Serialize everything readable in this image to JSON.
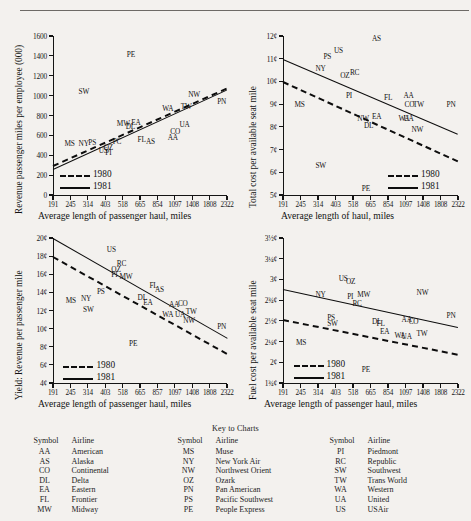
{
  "page": {
    "rule": "horizontal-rule"
  },
  "axis_ticks": {
    "x_values": [
      "191",
      "245",
      "314",
      "403",
      "518",
      "665",
      "854",
      "1097",
      "1408",
      "1808",
      "2322"
    ],
    "x_values_alt": [
      "191",
      "245",
      "314",
      "403",
      "518",
      "665",
      "857",
      "1097",
      "1408",
      "1808",
      "2322"
    ]
  },
  "legend": {
    "series_1980": "1980",
    "series_1981": "1981"
  },
  "charts": [
    {
      "id": "revenue-passenger-miles-per-employee",
      "ytitle": "Revenue passenger miles per employee (000)",
      "xtitle": "Average length of passenger haul, miles",
      "yticks": [
        "0",
        "200",
        "400",
        "600",
        "800",
        "1000",
        "1200",
        "1400",
        "1600"
      ],
      "xticks": [
        "191",
        "245",
        "314",
        "403",
        "518",
        "665",
        "854",
        "1097",
        "1408",
        "1808",
        "2322"
      ],
      "points": [
        "MS",
        "NY",
        "PS",
        "US",
        "OZ",
        "PI",
        "PC",
        "MW",
        "DL",
        "EA",
        "FL",
        "AS",
        "AA",
        "CO",
        "UA",
        "WA",
        "TW",
        "NW",
        "PN",
        "SW",
        "PE"
      ]
    },
    {
      "id": "total-cost-per-available-seat-mile",
      "ytitle": "Total cost per available seat mile",
      "xtitle": "Average length of haul, miles",
      "yticks": [
        "5¢",
        "6¢",
        "7¢",
        "8¢",
        "9¢",
        "10¢",
        "11¢",
        "12¢"
      ],
      "xticks": [
        "191",
        "245",
        "314",
        "403",
        "518",
        "665",
        "854",
        "1097",
        "1408",
        "1808",
        "2322"
      ],
      "points": [
        "MS",
        "NY",
        "PS",
        "US",
        "OZ",
        "RC",
        "PI",
        "NW",
        "DL",
        "EA",
        "FL",
        "WA",
        "UA",
        "AA",
        "CO",
        "TW",
        "NW",
        "PN",
        "AS",
        "SW",
        "PE"
      ]
    },
    {
      "id": "yield-revenue-per-passenger-mile",
      "ytitle": "Yield: Revenue per passenger mile",
      "xtitle": "Average length of passenger haul, miles",
      "yticks": [
        "4¢",
        "6¢",
        "8¢",
        "10¢",
        "12¢",
        "14¢",
        "16¢",
        "18¢",
        "20¢"
      ],
      "xticks": [
        "191",
        "245",
        "314",
        "403",
        "518",
        "665",
        "857",
        "1097",
        "1408",
        "1808",
        "2322"
      ],
      "points": [
        "MS",
        "NY",
        "PS",
        "US",
        "OZ",
        "RC",
        "PI",
        "MW",
        "DL",
        "EA",
        "FL",
        "AS",
        "WA",
        "AA",
        "CO",
        "UA",
        "TW",
        "NW",
        "PN",
        "SW",
        "PE"
      ]
    },
    {
      "id": "fuel-cost-per-available-seat-mile",
      "ytitle": "Fuel cost per available seat mile",
      "xtitle": "Average length of passenger haul, miles",
      "yticks": [
        "1¾¢",
        "2¢",
        "2¼¢",
        "2½¢",
        "2¾¢",
        "3¢",
        "3¼¢",
        "3½¢"
      ],
      "xticks": [
        "191",
        "245",
        "314",
        "403",
        "518",
        "665",
        "854",
        "1097",
        "1408",
        "1808",
        "2322"
      ],
      "points": [
        "MS",
        "NY",
        "PS",
        "SW",
        "US",
        "OZ",
        "PI",
        "RC",
        "MW",
        "DL",
        "FL",
        "EA",
        "WA",
        "UA",
        "AA",
        "CO",
        "TW",
        "NW",
        "PN",
        "PE"
      ]
    }
  ],
  "key": {
    "title": "Key to Charts",
    "head_symbol": "Symbol",
    "head_airline": "Airline",
    "columns": [
      [
        {
          "symbol": "AA",
          "airline": "American"
        },
        {
          "symbol": "AS",
          "airline": "Alaska"
        },
        {
          "symbol": "CO",
          "airline": "Continental"
        },
        {
          "symbol": "DL",
          "airline": "Delta"
        },
        {
          "symbol": "EA",
          "airline": "Eastern"
        },
        {
          "symbol": "FL",
          "airline": "Frontier"
        },
        {
          "symbol": "MW",
          "airline": "Midway"
        }
      ],
      [
        {
          "symbol": "MS",
          "airline": "Muse"
        },
        {
          "symbol": "NY",
          "airline": "New York Air"
        },
        {
          "symbol": "NW",
          "airline": "Northwest Orient"
        },
        {
          "symbol": "OZ",
          "airline": "Ozark"
        },
        {
          "symbol": "PN",
          "airline": "Pan American"
        },
        {
          "symbol": "PS",
          "airline": "Pacific Southwest"
        },
        {
          "symbol": "PE",
          "airline": "People Express"
        }
      ],
      [
        {
          "symbol": "PI",
          "airline": "Piedmont"
        },
        {
          "symbol": "RC",
          "airline": "Republic"
        },
        {
          "symbol": "SW",
          "airline": "Southwest"
        },
        {
          "symbol": "TW",
          "airline": "Trans World"
        },
        {
          "symbol": "WA",
          "airline": "Western"
        },
        {
          "symbol": "UA",
          "airline": "United"
        },
        {
          "symbol": "US",
          "airline": "USAir"
        }
      ]
    ]
  },
  "chart_data": [
    {
      "type": "scatter",
      "title": "Revenue passenger miles per employee (000)",
      "xlabel": "Average length of passenger haul, miles",
      "ylabel": "Revenue passenger miles per employee (000)",
      "xticklabels": [
        "191",
        "245",
        "314",
        "403",
        "518",
        "665",
        "854",
        "1097",
        "1408",
        "1808",
        "2322"
      ],
      "yticklabels": [
        "0",
        "200",
        "400",
        "600",
        "800",
        "1000",
        "1200",
        "1400",
        "1600"
      ],
      "ylim": [
        0,
        1600
      ],
      "xscale": "log-ordinal",
      "grid": false,
      "legend": [
        "1980",
        "1981"
      ],
      "legend_position": "lower-left-inside",
      "points": [
        {
          "label": "MS",
          "x": 245,
          "y": 520
        },
        {
          "label": "NY",
          "x": 300,
          "y": 520
        },
        {
          "label": "PS",
          "x": 345,
          "y": 530
        },
        {
          "label": "US",
          "x": 400,
          "y": 450
        },
        {
          "label": "OZ",
          "x": 430,
          "y": 480
        },
        {
          "label": "PI",
          "x": 440,
          "y": 430
        },
        {
          "label": "PC",
          "x": 490,
          "y": 545
        },
        {
          "label": "MW",
          "x": 520,
          "y": 720
        },
        {
          "label": "DL",
          "x": 590,
          "y": 690
        },
        {
          "label": "EA",
          "x": 640,
          "y": 730
        },
        {
          "label": "FL",
          "x": 700,
          "y": 560
        },
        {
          "label": "AS",
          "x": 790,
          "y": 545
        },
        {
          "label": "AA",
          "x": 1080,
          "y": 580
        },
        {
          "label": "CO",
          "x": 1120,
          "y": 640
        },
        {
          "label": "UA",
          "x": 1280,
          "y": 710
        },
        {
          "label": "WA",
          "x": 1000,
          "y": 880
        },
        {
          "label": "TW",
          "x": 1300,
          "y": 900
        },
        {
          "label": "NW",
          "x": 1450,
          "y": 1020
        },
        {
          "label": "PN",
          "x": 2200,
          "y": 950
        },
        {
          "label": "SW",
          "x": 300,
          "y": 1050
        },
        {
          "label": "PE",
          "x": 600,
          "y": 1420
        }
      ],
      "series": [
        {
          "name": "1980",
          "style": "dashed",
          "x": [
            191,
            2322
          ],
          "y": [
            300,
            1080
          ]
        },
        {
          "name": "1981",
          "style": "solid",
          "x": [
            191,
            2322
          ],
          "y": [
            260,
            1060
          ]
        }
      ]
    },
    {
      "type": "scatter",
      "title": "Total cost per available seat mile",
      "xlabel": "Average length of haul, miles",
      "ylabel": "Total cost per available seat mile",
      "xticklabels": [
        "191",
        "245",
        "314",
        "403",
        "518",
        "665",
        "854",
        "1097",
        "1408",
        "1808",
        "2322"
      ],
      "yticklabels": [
        "5¢",
        "6¢",
        "7¢",
        "8¢",
        "9¢",
        "10¢",
        "11¢",
        "12¢"
      ],
      "ylim": [
        5,
        12
      ],
      "grid": false,
      "legend": [
        "1980",
        "1981"
      ],
      "legend_position": "lower-right-inside",
      "points": [
        {
          "label": "MS",
          "x": 245,
          "y": 9.0
        },
        {
          "label": "NY",
          "x": 330,
          "y": 10.6
        },
        {
          "label": "PS",
          "x": 370,
          "y": 11.1
        },
        {
          "label": "US",
          "x": 430,
          "y": 11.4
        },
        {
          "label": "OZ",
          "x": 470,
          "y": 10.3
        },
        {
          "label": "RC",
          "x": 540,
          "y": 10.4
        },
        {
          "label": "PI",
          "x": 510,
          "y": 9.4
        },
        {
          "label": "NW",
          "x": 600,
          "y": 8.4
        },
        {
          "label": "DL",
          "x": 660,
          "y": 8.1
        },
        {
          "label": "EA",
          "x": 740,
          "y": 8.5
        },
        {
          "label": "FL",
          "x": 880,
          "y": 9.3
        },
        {
          "label": "WA",
          "x": 1080,
          "y": 8.4
        },
        {
          "label": "UA",
          "x": 1160,
          "y": 8.4
        },
        {
          "label": "AA",
          "x": 1160,
          "y": 9.4
        },
        {
          "label": "CO",
          "x": 1180,
          "y": 9.0
        },
        {
          "label": "TW",
          "x": 1330,
          "y": 9.0
        },
        {
          "label": "NW",
          "x": 1300,
          "y": 7.9
        },
        {
          "label": "PN",
          "x": 2150,
          "y": 9.0
        },
        {
          "label": "AS",
          "x": 740,
          "y": 11.9
        },
        {
          "label": "SW",
          "x": 330,
          "y": 6.3
        },
        {
          "label": "PE",
          "x": 640,
          "y": 5.3
        }
      ],
      "series": [
        {
          "name": "1981",
          "style": "solid",
          "x": [
            191,
            2322
          ],
          "y": [
            11.0,
            7.7
          ]
        },
        {
          "name": "1980",
          "style": "dashed",
          "x": [
            191,
            2322
          ],
          "y": [
            10.0,
            6.5
          ]
        }
      ]
    },
    {
      "type": "scatter",
      "title": "Yield: Revenue per passenger mile",
      "xlabel": "Average length of passenger haul, miles",
      "ylabel": "Yield: Revenue per passenger mile",
      "xticklabels": [
        "191",
        "245",
        "314",
        "403",
        "518",
        "665",
        "857",
        "1097",
        "1408",
        "1808",
        "2322"
      ],
      "yticklabels": [
        "4¢",
        "6¢",
        "8¢",
        "10¢",
        "12¢",
        "14¢",
        "16¢",
        "18¢",
        "20¢"
      ],
      "ylim": [
        4,
        20
      ],
      "grid": false,
      "legend": [
        "1980",
        "1981"
      ],
      "legend_position": "lower-left-inside",
      "points": [
        {
          "label": "MS",
          "x": 250,
          "y": 13.2
        },
        {
          "label": "NY",
          "x": 310,
          "y": 13.4
        },
        {
          "label": "PS",
          "x": 390,
          "y": 14.1
        },
        {
          "label": "US",
          "x": 450,
          "y": 18.8
        },
        {
          "label": "OZ",
          "x": 480,
          "y": 16.6
        },
        {
          "label": "RC",
          "x": 520,
          "y": 17.2
        },
        {
          "label": "PI",
          "x": 480,
          "y": 16.0
        },
        {
          "label": "MW",
          "x": 540,
          "y": 15.8
        },
        {
          "label": "DL",
          "x": 700,
          "y": 13.5
        },
        {
          "label": "EA",
          "x": 760,
          "y": 12.9
        },
        {
          "label": "FL",
          "x": 830,
          "y": 14.8
        },
        {
          "label": "AS",
          "x": 900,
          "y": 14.4
        },
        {
          "label": "WA",
          "x": 1000,
          "y": 11.6
        },
        {
          "label": "AA",
          "x": 1100,
          "y": 12.7
        },
        {
          "label": "CO",
          "x": 1250,
          "y": 12.8
        },
        {
          "label": "UA",
          "x": 1200,
          "y": 11.6
        },
        {
          "label": "TW",
          "x": 1400,
          "y": 11.9
        },
        {
          "label": "NW",
          "x": 1350,
          "y": 10.9
        },
        {
          "label": "PN",
          "x": 2200,
          "y": 10.3
        },
        {
          "label": "SW",
          "x": 320,
          "y": 12.2
        },
        {
          "label": "PE",
          "x": 620,
          "y": 8.4
        }
      ],
      "series": [
        {
          "name": "1981",
          "style": "solid",
          "x": [
            191,
            2322
          ],
          "y": [
            20.0,
            9.0
          ]
        },
        {
          "name": "1980",
          "style": "dashed",
          "x": [
            191,
            2322
          ],
          "y": [
            18.0,
            7.3
          ]
        }
      ]
    },
    {
      "type": "scatter",
      "title": "Fuel cost per available seat mile",
      "xlabel": "Average length of passenger haul, miles",
      "ylabel": "Fuel cost per available seat mile",
      "xticklabels": [
        "191",
        "245",
        "314",
        "403",
        "518",
        "665",
        "854",
        "1097",
        "1408",
        "1808",
        "2322"
      ],
      "yticklabels": [
        "1¾¢",
        "2¢",
        "2¼¢",
        "2½¢",
        "2¾¢",
        "3¢",
        "3¼¢",
        "3½¢"
      ],
      "ylim": [
        1.75,
        3.5
      ],
      "grid": false,
      "legend": [
        "1980",
        "1981"
      ],
      "legend_position": "lower-left-inside",
      "points": [
        {
          "label": "MS",
          "x": 250,
          "y": 2.25
        },
        {
          "label": "NY",
          "x": 330,
          "y": 2.82
        },
        {
          "label": "PS",
          "x": 390,
          "y": 2.55
        },
        {
          "label": "SW",
          "x": 390,
          "y": 2.48
        },
        {
          "label": "US",
          "x": 460,
          "y": 3.02
        },
        {
          "label": "OZ",
          "x": 510,
          "y": 2.98
        },
        {
          "label": "PI",
          "x": 520,
          "y": 2.8
        },
        {
          "label": "RC",
          "x": 560,
          "y": 2.72
        },
        {
          "label": "MW",
          "x": 600,
          "y": 2.82
        },
        {
          "label": "DL",
          "x": 740,
          "y": 2.5
        },
        {
          "label": "FL",
          "x": 790,
          "y": 2.47
        },
        {
          "label": "EA",
          "x": 830,
          "y": 2.38
        },
        {
          "label": "WA",
          "x": 1020,
          "y": 2.33
        },
        {
          "label": "UA",
          "x": 1130,
          "y": 2.32
        },
        {
          "label": "AA",
          "x": 1130,
          "y": 2.52
        },
        {
          "label": "CO",
          "x": 1250,
          "y": 2.5
        },
        {
          "label": "TW",
          "x": 1400,
          "y": 2.35
        },
        {
          "label": "NW",
          "x": 1400,
          "y": 2.85
        },
        {
          "label": "PN",
          "x": 2150,
          "y": 2.57
        },
        {
          "label": "PE",
          "x": 640,
          "y": 1.92
        }
      ],
      "series": [
        {
          "name": "1981",
          "style": "solid",
          "x": [
            191,
            2322
          ],
          "y": [
            2.88,
            2.42
          ]
        },
        {
          "name": "1980",
          "style": "dashed",
          "x": [
            191,
            2322
          ],
          "y": [
            2.52,
            2.1
          ]
        }
      ]
    }
  ]
}
